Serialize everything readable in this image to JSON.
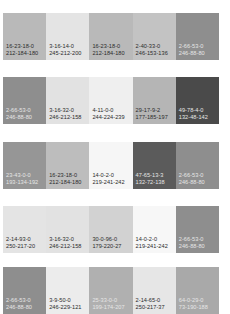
{
  "rows": [
    {
      "top": 13,
      "swatches": [
        {
          "cmyk": "16-23-18-0",
          "rgb": "212-184-180",
          "fill": "#b9b9b9",
          "tone": "light"
        },
        {
          "cmyk": "3-16-14-0",
          "rgb": "245-212-200",
          "fill": "#e4e4e4",
          "tone": "light"
        },
        {
          "cmyk": "16-23-18-0",
          "rgb": "212-184-180",
          "fill": "#b9b9b9",
          "tone": "light"
        },
        {
          "cmyk": "2-40-33-0",
          "rgb": "246-153-136",
          "fill": "#c3c3c3",
          "tone": "light"
        },
        {
          "cmyk": "2-66-53-0",
          "rgb": "246-88-80",
          "fill": "#8e8e8e",
          "tone": "dark"
        }
      ]
    },
    {
      "top": 77,
      "swatches": [
        {
          "cmyk": "2-66-53-0",
          "rgb": "246-88-80",
          "fill": "#8e8e8e",
          "tone": "dark"
        },
        {
          "cmyk": "3-16-32-0",
          "rgb": "246-212-158",
          "fill": "#e2e2e2",
          "tone": "light"
        },
        {
          "cmyk": "4-11-0-0",
          "rgb": "244-224-239",
          "fill": "#efefef",
          "tone": "light"
        },
        {
          "cmyk": "29-17-9-2",
          "rgb": "177-185-197",
          "fill": "#b5b5b5",
          "tone": "light"
        },
        {
          "cmyk": "49-78-4-0",
          "rgb": "132-48-142",
          "fill": "#4a4a4a",
          "tone": "dark"
        }
      ]
    },
    {
      "top": 142,
      "swatches": [
        {
          "cmyk": "23-43-0-0",
          "rgb": "193-134-192",
          "fill": "#969696",
          "tone": "dark"
        },
        {
          "cmyk": "16-23-18-0",
          "rgb": "212-184-180",
          "fill": "#bdbdbd",
          "tone": "light"
        },
        {
          "cmyk": "14-0-2-0",
          "rgb": "219-241-242",
          "fill": "#f6f6f6",
          "tone": "light"
        },
        {
          "cmyk": "47-65-13-3",
          "rgb": "132-72-138",
          "fill": "#5b5b5b",
          "tone": "dark"
        },
        {
          "cmyk": "2-66-53-0",
          "rgb": "246-88-80",
          "fill": "#8e8e8e",
          "tone": "dark"
        }
      ]
    },
    {
      "top": 206,
      "swatches": [
        {
          "cmyk": "2-14-93-0",
          "rgb": "250-217-20",
          "fill": "#e4e4e4",
          "tone": "light"
        },
        {
          "cmyk": "3-16-32-0",
          "rgb": "246-212-158",
          "fill": "#e2e2e2",
          "tone": "light"
        },
        {
          "cmyk": "30-0-96-0",
          "rgb": "179-220-27",
          "fill": "#d2d2d2",
          "tone": "light"
        },
        {
          "cmyk": "14-0-2-0",
          "rgb": "219-241-242",
          "fill": "#f7f7f7",
          "tone": "light"
        },
        {
          "cmyk": "2-66-53-0",
          "rgb": "246-88-80",
          "fill": "#8e8e8e",
          "tone": "dark"
        }
      ]
    },
    {
      "top": 267,
      "swatches": [
        {
          "cmyk": "2-66-53-0",
          "rgb": "246-88-80",
          "fill": "#8e8e8e",
          "tone": "dark"
        },
        {
          "cmyk": "3-9-50-0",
          "rgb": "246-229-121",
          "fill": "#ececec",
          "tone": "light"
        },
        {
          "cmyk": "25-33-0-0",
          "rgb": "199-174-207",
          "fill": "#b0b0b0",
          "tone": "dark"
        },
        {
          "cmyk": "2-14-65-0",
          "rgb": "250-217-37",
          "fill": "#e6e6e6",
          "tone": "light"
        },
        {
          "cmyk": "64-0-29-0",
          "rgb": "73-190-188",
          "fill": "#a9a9a9",
          "tone": "dark"
        }
      ]
    }
  ]
}
